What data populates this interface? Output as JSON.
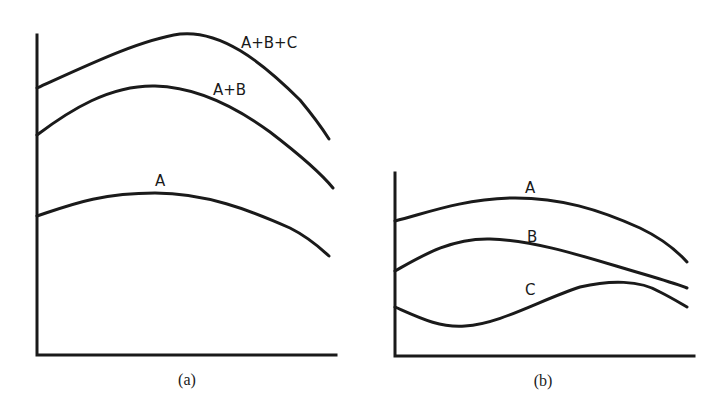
{
  "panels": [
    {
      "caption": "(a)",
      "curves": [
        {
          "label": "A+B+C"
        },
        {
          "label": "A+B"
        },
        {
          "label": "A"
        }
      ]
    },
    {
      "caption": "(b)",
      "curves": [
        {
          "label": "A"
        },
        {
          "label": "B"
        },
        {
          "label": "C"
        }
      ]
    }
  ],
  "colors": {
    "line": "#1a1a1a",
    "background": "#ffffff"
  }
}
